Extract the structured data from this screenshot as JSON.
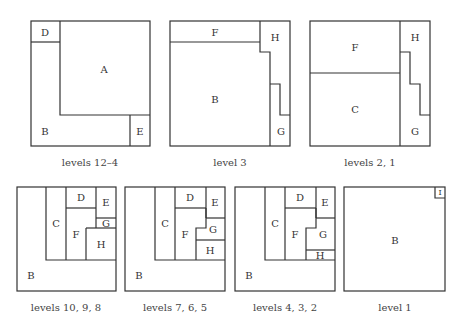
{
  "colors": {
    "line": "#333333",
    "text": "#333333",
    "background": "#ffffff"
  },
  "panels": [
    {
      "caption": "levels 12–4",
      "caption_pos": [
        90,
        162
      ],
      "outer": [
        31,
        21,
        119,
        125
      ],
      "lines": [
        "M31,42 H60",
        "M60,21 V115 H150",
        "M130,115 V146"
      ],
      "regions": [
        {
          "label": "D",
          "pos": [
            45,
            32
          ]
        },
        {
          "label": "A",
          "pos": [
            104,
            69
          ]
        },
        {
          "label": "B",
          "pos": [
            45,
            131
          ]
        },
        {
          "label": "E",
          "pos": [
            140,
            131
          ]
        }
      ]
    },
    {
      "caption": "level 3",
      "caption_pos": [
        230,
        162
      ],
      "outer": [
        170,
        21,
        120,
        125
      ],
      "lines": [
        "M170,42 H260",
        "M260,21 V52 H270 V146",
        "M270,84 H280 V115 H290"
      ],
      "regions": [
        {
          "label": "F",
          "pos": [
            215,
            32
          ]
        },
        {
          "label": "H",
          "pos": [
            275,
            37
          ]
        },
        {
          "label": "B",
          "pos": [
            215,
            99
          ]
        },
        {
          "label": "G",
          "pos": [
            281,
            131
          ]
        }
      ]
    },
    {
      "caption": "levels 2, 1",
      "caption_pos": [
        370,
        162
      ],
      "outer": [
        310,
        21,
        120,
        125
      ],
      "lines": [
        "M310,73 H400",
        "M400,21 V146",
        "M400,52 H410 V84 H420 V115 H430"
      ],
      "regions": [
        {
          "label": "F",
          "pos": [
            355,
            47
          ]
        },
        {
          "label": "H",
          "pos": [
            415,
            37
          ]
        },
        {
          "label": "C",
          "pos": [
            355,
            109
          ]
        },
        {
          "label": "G",
          "pos": [
            415,
            131
          ]
        }
      ]
    },
    {
      "caption": "levels 10, 9, 8",
      "caption_pos": [
        66,
        307
      ],
      "outer": [
        17,
        187,
        99,
        104
      ],
      "lines": [
        "M46,187 V260 H116",
        "M66,187 V260",
        "M66,208 H96",
        "M96,187 V228",
        "M96,218 H116",
        "M86,228 H116",
        "M86,228 V260"
      ],
      "regions": [
        {
          "label": "C",
          "pos": [
            56,
            223
          ]
        },
        {
          "label": "D",
          "pos": [
            81,
            197
          ]
        },
        {
          "label": "E",
          "pos": [
            106,
            202
          ]
        },
        {
          "label": "G",
          "pos": [
            106,
            223
          ]
        },
        {
          "label": "F",
          "pos": [
            76,
            234
          ]
        },
        {
          "label": "H",
          "pos": [
            101,
            244
          ]
        },
        {
          "label": "B",
          "pos": [
            31,
            275
          ]
        }
      ]
    },
    {
      "caption": "levels 7, 6, 5",
      "caption_pos": [
        175,
        307
      ],
      "outer": [
        125,
        187,
        100,
        104
      ],
      "lines": [
        "M155,187 V260 H225",
        "M175,187 V260",
        "M175,208 H206",
        "M206,187 V218",
        "M206,218 H225",
        "M206,208 V228 H196 V260",
        "M196,240 H225"
      ],
      "regions": [
        {
          "label": "C",
          "pos": [
            165,
            223
          ]
        },
        {
          "label": "D",
          "pos": [
            190,
            197
          ]
        },
        {
          "label": "E",
          "pos": [
            215,
            202
          ]
        },
        {
          "label": "G",
          "pos": [
            213,
            229
          ]
        },
        {
          "label": "F",
          "pos": [
            185,
            234
          ]
        },
        {
          "label": "H",
          "pos": [
            210,
            250
          ]
        },
        {
          "label": "B",
          "pos": [
            139,
            275
          ]
        }
      ]
    },
    {
      "caption": "levels 4, 3, 2",
      "caption_pos": [
        285,
        307
      ],
      "outer": [
        235,
        187,
        100,
        104
      ],
      "lines": [
        "M265,187 V260 H335",
        "M285,187 V260",
        "M285,208 H316",
        "M316,187 V218",
        "M316,218 H335",
        "M316,208 V228 H306 V260",
        "M306,250 H335"
      ],
      "regions": [
        {
          "label": "C",
          "pos": [
            275,
            223
          ]
        },
        {
          "label": "D",
          "pos": [
            300,
            197
          ]
        },
        {
          "label": "E",
          "pos": [
            325,
            202
          ]
        },
        {
          "label": "G",
          "pos": [
            323,
            234
          ]
        },
        {
          "label": "F",
          "pos": [
            295,
            234
          ]
        },
        {
          "label": "H",
          "pos": [
            320,
            255
          ]
        },
        {
          "label": "B",
          "pos": [
            249,
            275
          ]
        }
      ]
    },
    {
      "caption": "level 1",
      "caption_pos": [
        395,
        307
      ],
      "outer": [
        344,
        187,
        101,
        104
      ],
      "lines": [
        "M435,187 V198 H445"
      ],
      "regions": [
        {
          "label": "B",
          "pos": [
            395,
            240
          ]
        },
        {
          "label": "I",
          "pos": [
            440,
            192.5
          ],
          "tiny": true
        }
      ]
    }
  ]
}
